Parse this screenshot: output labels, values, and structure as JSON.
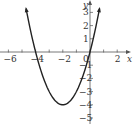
{
  "chart_data": {
    "type": "line",
    "title": "",
    "equation": "y = x^2 + 4x",
    "vertex": [
      -2,
      -4
    ],
    "roots": [
      -4,
      0
    ],
    "xlabel": "x",
    "ylabel": "y",
    "xlim": [
      -6.5,
      3.2
    ],
    "ylim": [
      -5.5,
      3.8
    ],
    "x_tick_labels": [
      "-6",
      "-4",
      "-2",
      "0",
      "2"
    ],
    "y_tick_labels": [
      "3",
      "2",
      "1",
      "-1",
      "-2",
      "-3",
      "-4",
      "-5"
    ],
    "x_ticks": [
      -6,
      -5,
      -4,
      -3,
      -2,
      -1,
      0,
      1,
      2
    ],
    "y_ticks": [
      -5,
      -4,
      -3,
      -2,
      -1,
      1,
      2,
      3
    ],
    "grid": false,
    "series": [
      {
        "name": "parabola",
        "x": [
          -4.7,
          -4,
          -3,
          -2,
          -1,
          0,
          0.7
        ],
        "values": [
          3.69,
          0,
          -3,
          -4,
          -3,
          0,
          3.29
        ]
      }
    ],
    "colors": {
      "curve": "#222222",
      "axes": "#555555",
      "text": "#333333"
    }
  }
}
